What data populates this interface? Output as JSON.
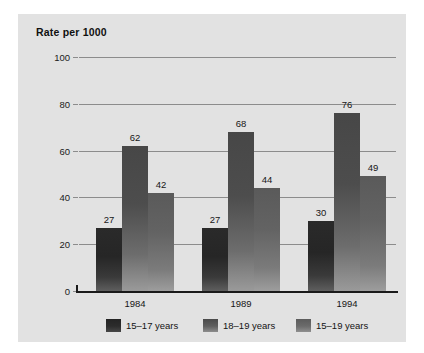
{
  "chart_data": {
    "type": "bar",
    "title": "Rate per 1000",
    "xlabel": "",
    "ylabel": "Rate per 1000",
    "categories": [
      "1984",
      "1989",
      "1994"
    ],
    "series": [
      {
        "name": "15–17 years",
        "values": [
          27,
          27,
          30
        ],
        "color": "#2a2a2a"
      },
      {
        "name": "18–19 years",
        "values": [
          62,
          68,
          76
        ],
        "color": "#5a5a5a"
      },
      {
        "name": "15–19 years",
        "values": [
          42,
          44,
          49
        ],
        "color": "#7b7b7b"
      }
    ],
    "ylim": [
      0,
      100
    ],
    "yticks": [
      0,
      20,
      40,
      60,
      80,
      100
    ],
    "ytick_labels": [
      "0",
      "20",
      "40",
      "60",
      "80",
      "100"
    ],
    "grid": true,
    "legend_position": "bottom",
    "data_labels": true
  },
  "panel": {
    "background_color": "#e2e2e2",
    "gridline_color": "#8c8c8c",
    "axis_color": "#1a1a1a"
  }
}
